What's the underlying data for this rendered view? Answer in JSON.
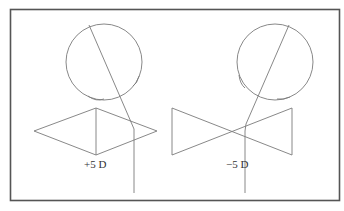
{
  "figure": {
    "panels": [
      {
        "id": "convex",
        "lens_label": "+5 D",
        "lens_shape": "diamond (converging)",
        "eye": {
          "cx": 104,
          "cy": 62,
          "r": 38
        },
        "ray": [
          [
            89,
            25
          ],
          [
            131,
            122
          ],
          [
            134,
            193
          ]
        ],
        "lens_points": [
          [
            34,
            131
          ],
          [
            96,
            108
          ],
          [
            157,
            131
          ],
          [
            96,
            155
          ]
        ],
        "lens_axis": [
          [
            96,
            108
          ],
          [
            96,
            155
          ]
        ],
        "label_pos": [
          84,
          168
        ]
      },
      {
        "id": "concave",
        "lens_label": "−5 D",
        "lens_shape": "bowtie (diverging)",
        "eye": {
          "cx": 275,
          "cy": 62,
          "r": 38
        },
        "ray": [
          [
            289,
            25
          ],
          [
            246,
            124
          ],
          [
            245,
            193
          ]
        ],
        "lens_points": [
          [
            172,
            108
          ],
          [
            292,
            155
          ],
          [
            292,
            108
          ],
          [
            172,
            155
          ]
        ],
        "label_pos": [
          226,
          168
        ]
      }
    ],
    "colors": {
      "line": "#7a7a7a",
      "frame": "#555555",
      "text": "#333333"
    }
  }
}
